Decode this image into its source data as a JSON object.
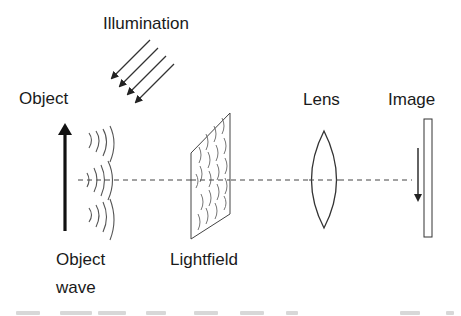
{
  "diagram": {
    "type": "optical-setup",
    "labels": {
      "illumination": "Illumination",
      "object": "Object",
      "object_wave_line1": "Object",
      "object_wave_line2": "wave",
      "lightfield": "Lightfield",
      "lens": "Lens",
      "image": "Image"
    },
    "colors": {
      "stroke": "#333333",
      "text": "#1a1a1a",
      "background": "#ffffff"
    },
    "components": [
      {
        "id": "illumination",
        "description": "four parallel diagonal arrows pointing down-left"
      },
      {
        "id": "object",
        "description": "upright thick arrow"
      },
      {
        "id": "object-wave",
        "description": "three groups of concentric wavefront arcs"
      },
      {
        "id": "lightfield",
        "description": "parallelogram plate filled with arc fragments"
      },
      {
        "id": "lens",
        "description": "biconvex lens"
      },
      {
        "id": "image",
        "description": "image plane with inverted arrow"
      }
    ],
    "optical_axis": "dashed horizontal line"
  }
}
